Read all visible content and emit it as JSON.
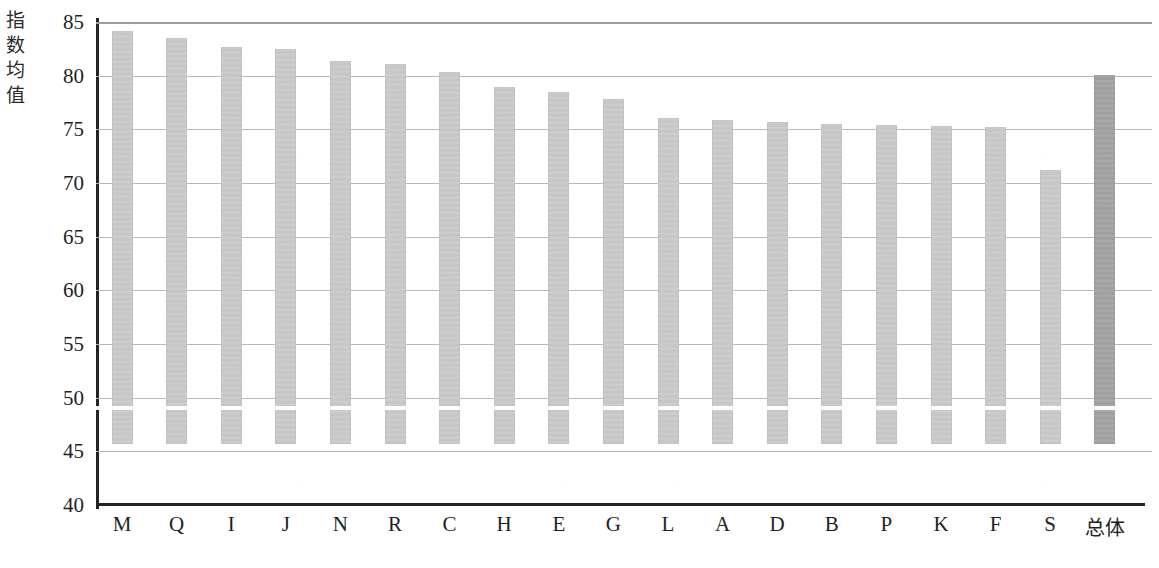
{
  "chart_data": {
    "type": "bar",
    "title": "",
    "xlabel": "",
    "ylabel": "指数均值",
    "ylim": [
      40,
      85
    ],
    "ytick_step": 5,
    "yticks": [
      85,
      80,
      75,
      70,
      65,
      60,
      55,
      50,
      45,
      40
    ],
    "grid": true,
    "legend": "none",
    "categories": [
      "M",
      "Q",
      "I",
      "J",
      "N",
      "R",
      "C",
      "H",
      "E",
      "G",
      "L",
      "A",
      "D",
      "B",
      "P",
      "K",
      "F",
      "S",
      "总体"
    ],
    "values": [
      78.5,
      77.8,
      77.0,
      76.8,
      75.7,
      75.4,
      74.7,
      73.3,
      72.8,
      72.1,
      70.4,
      70.2,
      70.0,
      69.8,
      69.7,
      69.6,
      69.5,
      65.5,
      74.4
    ],
    "bar_colors": [
      "#c9c9c9",
      "#c9c9c9",
      "#c9c9c9",
      "#c9c9c9",
      "#c9c9c9",
      "#c9c9c9",
      "#c9c9c9",
      "#c9c9c9",
      "#c9c9c9",
      "#c9c9c9",
      "#c9c9c9",
      "#c9c9c9",
      "#c9c9c9",
      "#c9c9c9",
      "#c9c9c9",
      "#c9c9c9",
      "#c9c9c9",
      "#c9c9c9",
      "#a2a2a2"
    ],
    "highlight_index": 18,
    "axis_color": "#232323",
    "gridline_color": "#b9b9b9"
  }
}
